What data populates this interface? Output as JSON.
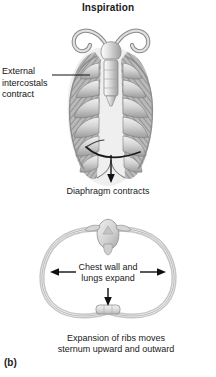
{
  "figure": {
    "title": "Inspiration",
    "panel_letter": "(b)",
    "background_color": "#ffffff",
    "text_color": "#1a1a1a"
  },
  "labels": {
    "external_intercostals": "External\nintercostals\ncontract",
    "external_intercostals_lines": [
      "External",
      "intercostals",
      "contract"
    ],
    "diaphragm": "Diaphragm contracts",
    "chest_wall": "Chest wall and\nlungs expand",
    "chest_wall_lines": [
      "Chest wall and",
      "lungs expand"
    ],
    "expansion": "Expansion of ribs moves\nsternum upward and outward",
    "expansion_lines": [
      "Expansion of ribs moves",
      "sternum upward and outward"
    ]
  },
  "icons": {
    "leader_line": "leader-line",
    "down_arrow_diaphragm": "down-arrow-icon",
    "left_arrow": "left-arrow-icon",
    "right_arrow": "right-arrow-icon",
    "down_arrow_sternum": "down-arrow-icon"
  },
  "anatomy": {
    "upper_view": "anterior-ribcage",
    "lower_view": "transverse-thorax-section",
    "parts": [
      "clavicle-left",
      "clavicle-right",
      "sternum",
      "ribs",
      "external-intercostal-muscles",
      "diaphragm",
      "vertebra",
      "chest-wall"
    ]
  },
  "colors": {
    "bone_light": "#dcdcdc",
    "bone_mid": "#b4b4b4",
    "bone_dark": "#8a8a8a",
    "muscle": "#9a9a9a",
    "outline": "#6e6e6e",
    "arrow": "#111111"
  }
}
